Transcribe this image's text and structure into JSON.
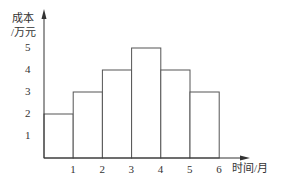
{
  "chart_data": {
    "type": "bar",
    "title": "",
    "xlabel": "时间/月",
    "ylabel": "成本 /万元",
    "ylabel_lines": [
      "成本",
      "/万元"
    ],
    "x_ticks": [
      "1",
      "2",
      "3",
      "4",
      "5",
      "6"
    ],
    "y_ticks": [
      "1",
      "2",
      "3",
      "4",
      "5"
    ],
    "bins": [
      [
        0,
        1
      ],
      [
        1,
        2
      ],
      [
        2,
        3
      ],
      [
        3,
        4
      ],
      [
        4,
        5
      ],
      [
        5,
        6
      ]
    ],
    "categories": [
      "0-1",
      "1-2",
      "2-3",
      "3-4",
      "4-5",
      "5-6"
    ],
    "values": [
      2,
      3,
      4,
      5,
      4,
      3
    ],
    "xlim": [
      0,
      7
    ],
    "ylim": [
      0,
      6
    ],
    "grid": false,
    "legend": null,
    "colors": {
      "stroke": "#555555",
      "axis": "#333333",
      "fill": "#ffffff"
    }
  }
}
